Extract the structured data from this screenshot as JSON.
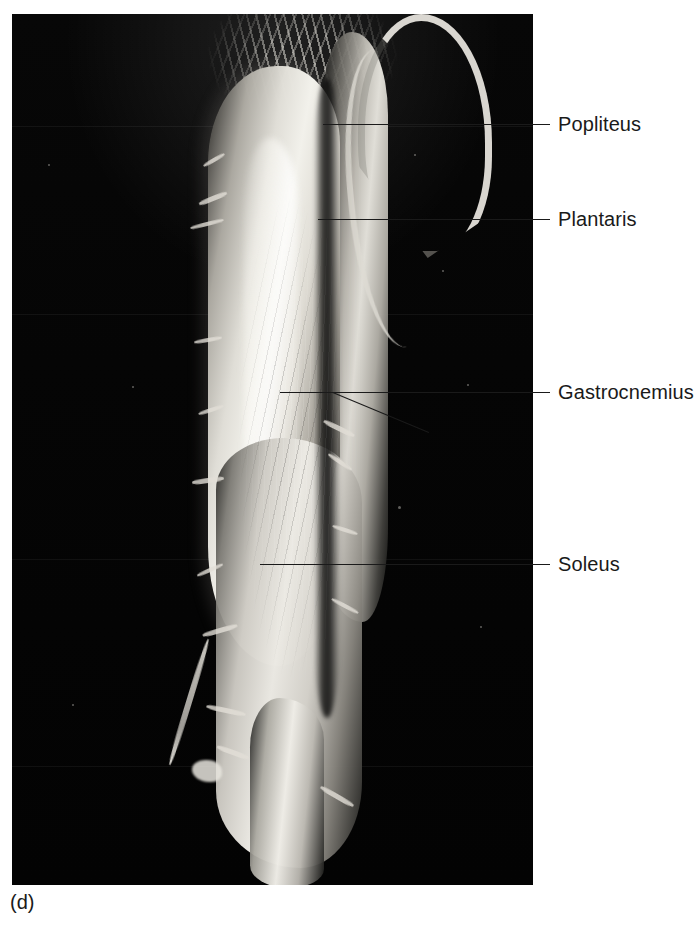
{
  "figure": {
    "caption": "(d)",
    "plate_background": "#040404",
    "label_color": "#1a1a1a",
    "page_background": "#ffffff"
  },
  "photo": {
    "alt_name": "posterior-leg-dissection",
    "description": "Black-and-white cadaver photograph of a dissected posterior leg showing the superficial posterior compartment muscles"
  },
  "callouts": [
    {
      "id": "popliteus",
      "label": "Popliteus"
    },
    {
      "id": "plantaris",
      "label": "Plantaris"
    },
    {
      "id": "gastrocnemius",
      "label": "Gastrocnemius"
    },
    {
      "id": "soleus",
      "label": "Soleus"
    }
  ]
}
